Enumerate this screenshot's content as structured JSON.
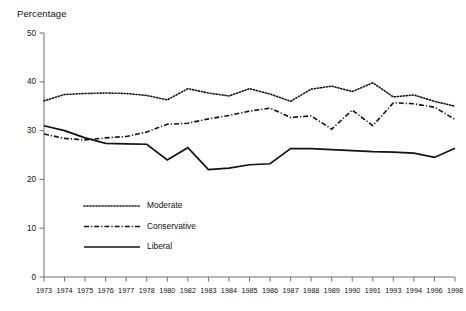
{
  "chart_data": {
    "type": "line",
    "title": "",
    "ylabel": "Percentage",
    "xlabel": "",
    "ylim": [
      0,
      50
    ],
    "yticks": [
      0,
      10,
      20,
      30,
      40,
      50
    ],
    "grid": false,
    "legend_position": "inside-lower-left",
    "categories": [
      "1973",
      "1974",
      "1975",
      "1976",
      "1977",
      "1978",
      "1980",
      "1982",
      "1983",
      "1984",
      "1985",
      "1986",
      "1987",
      "1988",
      "1989",
      "1990",
      "1991",
      "1993",
      "1994",
      "1996",
      "1998"
    ],
    "series": [
      {
        "name": "Moderate",
        "style": "dotted",
        "values": [
          36.1,
          37.4,
          37.6,
          37.7,
          37.6,
          37.2,
          36.3,
          38.6,
          37.7,
          37.1,
          38.6,
          37.5,
          36.0,
          38.5,
          39.1,
          38.0,
          39.8,
          36.9,
          37.3,
          36.0,
          35.0
        ]
      },
      {
        "name": "Conservative",
        "style": "dash-dot",
        "values": [
          29.3,
          28.4,
          28.1,
          28.5,
          28.8,
          29.7,
          31.3,
          31.5,
          32.4,
          33.1,
          34.0,
          34.6,
          32.7,
          33.0,
          30.3,
          34.2,
          31.0,
          35.7,
          35.5,
          34.8,
          32.3
        ]
      },
      {
        "name": "Liberal",
        "style": "solid",
        "values": [
          31.0,
          30.0,
          28.5,
          27.4,
          27.3,
          27.2,
          24.0,
          26.5,
          22.0,
          22.3,
          23.0,
          23.2,
          26.3,
          26.3,
          26.1,
          25.9,
          25.7,
          25.6,
          25.4,
          24.5,
          26.4
        ]
      }
    ],
    "legend": [
      {
        "label": "Moderate",
        "style": "dotted"
      },
      {
        "label": "Conservative",
        "style": "dash-dot"
      },
      {
        "label": "Liberal",
        "style": "solid"
      }
    ],
    "colors": {
      "ink": "#111111",
      "axis": "#6f6f6f",
      "background": "#ffffff"
    }
  }
}
